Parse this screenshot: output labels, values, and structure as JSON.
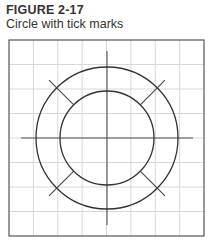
{
  "figure": {
    "label": "FIGURE 2-17",
    "caption": "Circle with tick marks"
  },
  "diagram": {
    "frame": {
      "x": 9,
      "y": 40,
      "width": 195,
      "height": 196
    },
    "grid": {
      "cells": 8,
      "color": "#d8d8d8"
    },
    "center": {
      "x": 107,
      "y": 138
    },
    "circles": [
      {
        "name": "outer-circle",
        "r": 71
      },
      {
        "name": "inner-circle",
        "r": 47
      }
    ],
    "axes": {
      "h_half_length": 86,
      "v_half_length": 87
    },
    "diagonal_ticks": {
      "inner_r": 47,
      "outer_r": 82,
      "angles_deg": [
        45,
        135,
        225,
        315
      ]
    },
    "stroke_color": "#333333"
  }
}
